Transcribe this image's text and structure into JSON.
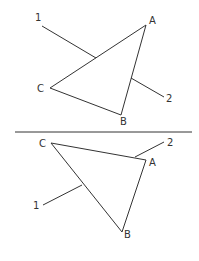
{
  "figures": [
    {
      "name": "top",
      "vertices": {
        "A": {
          "label": "A",
          "x": 146,
          "y": 25,
          "lx": 149,
          "ly": 24
        },
        "B": {
          "label": "B",
          "x": 121,
          "y": 115,
          "lx": 120,
          "ly": 125
        },
        "C": {
          "label": "C",
          "x": 50,
          "y": 88,
          "lx": 37,
          "ly": 92
        }
      },
      "leaders": [
        {
          "label": "1",
          "x1": 42,
          "y1": 26,
          "x2": 96,
          "y2": 58,
          "lx": 35,
          "ly": 21
        },
        {
          "label": "2",
          "x1": 131,
          "y1": 78,
          "x2": 164,
          "y2": 97,
          "lx": 166,
          "ly": 102
        }
      ]
    },
    {
      "name": "bottom",
      "vertices": {
        "A": {
          "label": "A",
          "x": 146,
          "y": 160,
          "lx": 149,
          "ly": 166
        },
        "B": {
          "label": "B",
          "x": 122,
          "y": 232,
          "lx": 124,
          "ly": 238
        },
        "C": {
          "label": "C",
          "x": 51,
          "y": 143,
          "lx": 39,
          "ly": 147
        }
      },
      "leaders": [
        {
          "label": "2",
          "x1": 135,
          "y1": 157,
          "x2": 164,
          "y2": 142,
          "lx": 167,
          "ly": 146
        },
        {
          "label": "1",
          "x1": 43,
          "y1": 205,
          "x2": 82,
          "y2": 185,
          "lx": 33,
          "ly": 209
        }
      ]
    }
  ],
  "divider": {
    "x1": 15,
    "y1": 132,
    "x2": 192,
    "y2": 132
  }
}
